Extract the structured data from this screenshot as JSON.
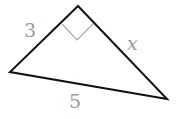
{
  "diagram": {
    "type": "right-triangle",
    "vertices": {
      "top": [
        78,
        6
      ],
      "left": [
        10,
        72
      ],
      "right": [
        167,
        99
      ]
    },
    "right_angle_at": "top",
    "labels": {
      "leg_left": "3",
      "leg_right": "x",
      "hypotenuse": "5"
    },
    "colors": {
      "edge": "#111111",
      "marker": "#a8a8a8",
      "label": "#9a9a9a"
    }
  }
}
